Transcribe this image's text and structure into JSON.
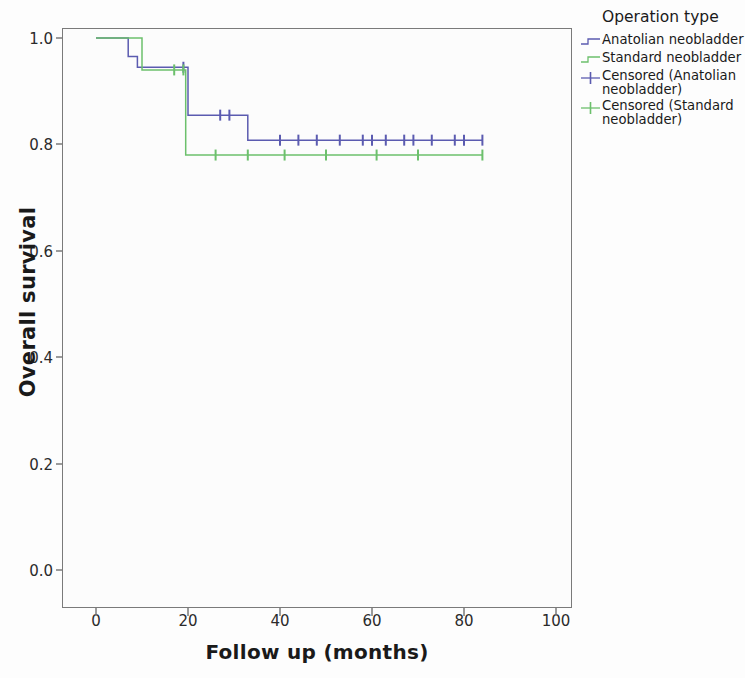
{
  "chart_data": {
    "type": "line",
    "title": "",
    "xlabel": "Follow up (months)",
    "ylabel": "Overall survival",
    "xlim": [
      -4,
      108
    ],
    "ylim": [
      0.0,
      1.04
    ],
    "xticks": [
      0,
      20,
      40,
      60,
      80,
      100
    ],
    "xtick_labels": [
      "0",
      "20",
      "40",
      "60",
      "80",
      "100"
    ],
    "yticks": [
      0.0,
      0.2,
      0.4,
      0.6,
      0.8,
      1.0
    ],
    "ytick_labels": [
      "0.0",
      "0.2",
      "0.4",
      "0.6",
      "0.8",
      "1.0"
    ],
    "grid": false,
    "legend_position": "right",
    "step_type": "post",
    "series": [
      {
        "name": "Anatolian neobladder",
        "color": "#5b5bb0",
        "type": "step",
        "x": [
          0,
          7,
          9,
          20,
          33,
          84
        ],
        "y": [
          1.0,
          0.965,
          0.945,
          0.855,
          0.808,
          0.808
        ],
        "censored_x": [
          19,
          27,
          29,
          40,
          44,
          48,
          53,
          58,
          60,
          63,
          67,
          69,
          73,
          78,
          80,
          84
        ],
        "censored_y": [
          0.945,
          0.855,
          0.855,
          0.808,
          0.808,
          0.808,
          0.808,
          0.808,
          0.808,
          0.808,
          0.808,
          0.808,
          0.808,
          0.808,
          0.808,
          0.808
        ]
      },
      {
        "name": "Standard neobladder",
        "color": "#6cc06c",
        "type": "step",
        "x": [
          0,
          10,
          19.5,
          84
        ],
        "y": [
          1.0,
          0.94,
          0.78,
          0.78
        ],
        "censored_x": [
          17,
          19,
          26,
          33,
          41,
          50,
          61,
          70,
          84
        ],
        "censored_y": [
          0.94,
          0.94,
          0.78,
          0.78,
          0.78,
          0.78,
          0.78,
          0.78,
          0.78
        ]
      }
    ]
  },
  "legend": {
    "title": "Operation type",
    "entries": [
      {
        "label": "Anatolian neobladder",
        "color": "#5b5bb0",
        "symbol": "step-line"
      },
      {
        "label": "Standard neobladder",
        "color": "#6cc06c",
        "symbol": "step-line"
      },
      {
        "label": "Censored (Anatolian neobladder)",
        "color": "#5b5bb0",
        "symbol": "plus-marker"
      },
      {
        "label": "Censored (Standard neobladder)",
        "color": "#6cc06c",
        "symbol": "plus-marker"
      }
    ]
  },
  "axes": {
    "x_title": "Follow up (months)",
    "y_title": "Overall survival"
  }
}
